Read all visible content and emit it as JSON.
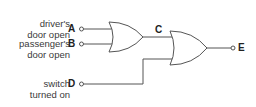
{
  "diagram": {
    "type": "logic-circuit",
    "inputs": [
      {
        "id": "A",
        "label_line1": "driver's",
        "label_line2": "door open"
      },
      {
        "id": "B",
        "label_line1": "passenger's",
        "label_line2": "door open"
      },
      {
        "id": "D",
        "label_line1": "switch",
        "label_line2": "turned on"
      }
    ],
    "intermediate": {
      "id": "C"
    },
    "output": {
      "id": "E"
    },
    "gates": [
      {
        "name": "OR gate 1",
        "inputs": [
          "A",
          "B"
        ],
        "output": "C"
      },
      {
        "name": "OR gate 2",
        "inputs": [
          "C",
          "D"
        ],
        "output": "E"
      }
    ],
    "line_color": "#555555"
  }
}
